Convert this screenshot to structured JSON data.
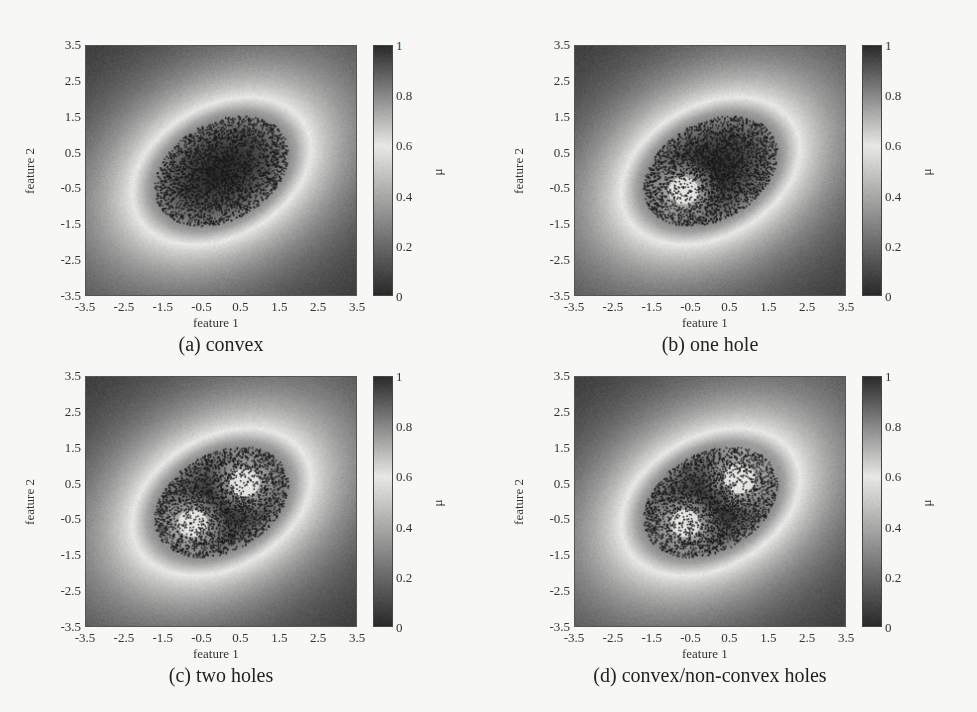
{
  "figure": {
    "background": "#f7f7f5",
    "colormap": {
      "name": "gray-diverging",
      "stops": [
        {
          "v": 0.0,
          "color": "#2a2a2a"
        },
        {
          "v": 0.25,
          "color": "#7a7a7a"
        },
        {
          "v": 0.6,
          "color": "#e8e8e6"
        },
        {
          "v": 0.8,
          "color": "#8a8a8a"
        },
        {
          "v": 1.0,
          "color": "#2c2c2c"
        }
      ]
    }
  },
  "chart_data": [
    {
      "type": "heatmap",
      "title": "(a) convex",
      "xlabel": "feature 1",
      "ylabel": "feature 2",
      "xlim": [
        -3.5,
        3.5
      ],
      "ylim": [
        -3.5,
        3.5
      ],
      "xticks": [
        "-3.5",
        "-2.5",
        "-1.5",
        "-0.5",
        "0.5",
        "1.5",
        "2.5",
        "3.5"
      ],
      "yticks": [
        "3.5",
        "2.5",
        "1.5",
        "0.5",
        "-0.5",
        "-1.5",
        "-2.5",
        "-3.5"
      ],
      "colorbar": {
        "label": "μ",
        "range": [
          0,
          1
        ],
        "ticks": [
          "1",
          "0.8",
          "0.6",
          "0.4",
          "0.2",
          "0"
        ]
      },
      "overlay": "scatter of training samples (dark dots)",
      "field": {
        "clusters": [
          {
            "cx": 0.0,
            "cy": 0.0,
            "rx": 2.1,
            "ry": 1.5,
            "angle": 35,
            "kind": "convex"
          }
        ],
        "holes": []
      },
      "scatter": {
        "count": 2600,
        "cx": 0.0,
        "cy": 0.0,
        "rx": 1.9,
        "ry": 1.35,
        "angle": 35,
        "hole_rings": []
      }
    },
    {
      "type": "heatmap",
      "title": "(b) one hole",
      "xlabel": "feature 1",
      "ylabel": "feature 2",
      "xlim": [
        -3.5,
        3.5
      ],
      "ylim": [
        -3.5,
        3.5
      ],
      "xticks": [
        "-3.5",
        "-2.5",
        "-1.5",
        "-0.5",
        "0.5",
        "1.5",
        "2.5",
        "3.5"
      ],
      "yticks": [
        "3.5",
        "2.5",
        "1.5",
        "0.5",
        "-0.5",
        "-1.5",
        "-2.5",
        "-3.5"
      ],
      "colorbar": {
        "label": "μ",
        "range": [
          0,
          1
        ],
        "ticks": [
          "1",
          "0.8",
          "0.6",
          "0.4",
          "0.2",
          "0"
        ]
      },
      "overlay": "scatter of training samples (dark dots)",
      "field": {
        "clusters": [
          {
            "cx": 0.0,
            "cy": 0.0,
            "rx": 2.1,
            "ry": 1.5,
            "angle": 35,
            "kind": "convex"
          }
        ],
        "holes": [
          {
            "cx": -0.7,
            "cy": -0.55,
            "r": 0.85
          }
        ]
      },
      "scatter": {
        "count": 2600,
        "cx": 0.0,
        "cy": 0.0,
        "rx": 1.9,
        "ry": 1.35,
        "angle": 35,
        "hole_rings": [
          {
            "cx": -0.7,
            "cy": -0.55,
            "r_in": 0.45,
            "r_out": 1.25
          }
        ]
      }
    },
    {
      "type": "heatmap",
      "title": "(c) two holes",
      "xlabel": "feature 1",
      "ylabel": "feature 2",
      "xlim": [
        -3.5,
        3.5
      ],
      "ylim": [
        -3.5,
        3.5
      ],
      "xticks": [
        "-3.5",
        "-2.5",
        "-1.5",
        "-0.5",
        "0.5",
        "1.5",
        "2.5",
        "3.5"
      ],
      "yticks": [
        "3.5",
        "2.5",
        "1.5",
        "0.5",
        "-0.5",
        "-1.5",
        "-2.5",
        "-3.5"
      ],
      "colorbar": {
        "label": "μ",
        "range": [
          0,
          1
        ],
        "ticks": [
          "1",
          "0.8",
          "0.6",
          "0.4",
          "0.2",
          "0"
        ]
      },
      "overlay": "scatter of training samples (dark dots)",
      "field": {
        "clusters": [
          {
            "cx": 0.0,
            "cy": 0.0,
            "rx": 2.1,
            "ry": 1.5,
            "angle": 35,
            "kind": "convex"
          }
        ],
        "holes": [
          {
            "cx": -0.75,
            "cy": -0.6,
            "r": 0.85
          },
          {
            "cx": 0.6,
            "cy": 0.55,
            "r": 0.85
          }
        ]
      },
      "scatter": {
        "count": 2400,
        "cx": 0.0,
        "cy": 0.0,
        "rx": 1.9,
        "ry": 1.35,
        "angle": 35,
        "hole_rings": [
          {
            "cx": -0.75,
            "cy": -0.6,
            "r_in": 0.4,
            "r_out": 0.85
          },
          {
            "cx": 0.6,
            "cy": 0.55,
            "r_in": 0.4,
            "r_out": 0.85
          }
        ]
      }
    },
    {
      "type": "heatmap",
      "title": "(d) convex/non-convex holes",
      "xlabel": "feature 1",
      "ylabel": "feature 2",
      "xlim": [
        -3.5,
        3.5
      ],
      "ylim": [
        -3.5,
        3.5
      ],
      "xticks": [
        "-3.5",
        "-2.5",
        "-1.5",
        "-0.5",
        "0.5",
        "1.5",
        "2.5",
        "3.5"
      ],
      "yticks": [
        "3.5",
        "2.5",
        "1.5",
        "0.5",
        "-0.5",
        "-1.5",
        "-2.5",
        "-3.5"
      ],
      "colorbar": {
        "label": "μ",
        "range": [
          0,
          1
        ],
        "ticks": [
          "1",
          "0.8",
          "0.6",
          "0.4",
          "0.2",
          "0"
        ]
      },
      "overlay": "scatter of training samples (dark dots)",
      "field": {
        "clusters": [
          {
            "cx": 0.0,
            "cy": 0.0,
            "rx": 2.1,
            "ry": 1.5,
            "angle": 35,
            "kind": "convex"
          }
        ],
        "holes": [
          {
            "cx": -0.65,
            "cy": -0.6,
            "r": 0.85
          },
          {
            "cx": 0.75,
            "cy": 0.65,
            "r": 0.9,
            "notch": true
          }
        ]
      },
      "scatter": {
        "count": 2400,
        "cx": 0.0,
        "cy": 0.0,
        "rx": 1.9,
        "ry": 1.35,
        "angle": 35,
        "hole_rings": [
          {
            "cx": -0.65,
            "cy": -0.6,
            "r_in": 0.4,
            "r_out": 0.85
          },
          {
            "cx": 0.75,
            "cy": 0.65,
            "r_in": 0.4,
            "r_out": 0.9
          }
        ]
      }
    }
  ],
  "panels": [
    {
      "left": 0,
      "top": 0
    },
    {
      "left": 489,
      "top": 0
    },
    {
      "left": 0,
      "top": 331
    },
    {
      "left": 489,
      "top": 331
    }
  ]
}
